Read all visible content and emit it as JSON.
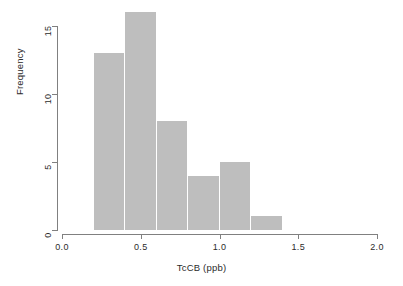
{
  "chart_data": {
    "type": "bar",
    "title": "",
    "subtitle": "",
    "xlabel": "TcCB (ppb)",
    "ylabel": "Frequency",
    "bar_color": "#bebebe",
    "axis_color": "#808080",
    "grid": false,
    "legend": null,
    "xlim": [
      0.0,
      2.0
    ],
    "ylim": [
      0,
      16
    ],
    "bin_width": 0.2,
    "bins": [
      {
        "left": 0.2,
        "right": 0.4,
        "center": 0.3,
        "count": 13
      },
      {
        "left": 0.4,
        "right": 0.6,
        "center": 0.5,
        "count": 16
      },
      {
        "left": 0.6,
        "right": 0.8,
        "center": 0.7,
        "count": 8
      },
      {
        "left": 0.8,
        "right": 1.0,
        "center": 0.9,
        "count": 4
      },
      {
        "left": 1.0,
        "right": 1.2,
        "center": 1.1,
        "count": 5
      },
      {
        "left": 1.2,
        "right": 1.4,
        "center": 1.3,
        "count": 1
      }
    ],
    "categories": [
      "0.2-0.4",
      "0.4-0.6",
      "0.6-0.8",
      "0.8-1.0",
      "1.0-1.2",
      "1.2-1.4"
    ],
    "values": [
      13,
      16,
      8,
      4,
      5,
      1
    ],
    "xticks": [
      {
        "value": 0.0,
        "label": "0.0"
      },
      {
        "value": 0.5,
        "label": "0.5"
      },
      {
        "value": 1.0,
        "label": "1.0"
      },
      {
        "value": 1.5,
        "label": "1.5"
      },
      {
        "value": 2.0,
        "label": "2.0"
      }
    ],
    "yticks": [
      {
        "value": 0,
        "label": "0"
      },
      {
        "value": 5,
        "label": "5"
      },
      {
        "value": 10,
        "label": "10"
      },
      {
        "value": 15,
        "label": "15"
      }
    ]
  }
}
